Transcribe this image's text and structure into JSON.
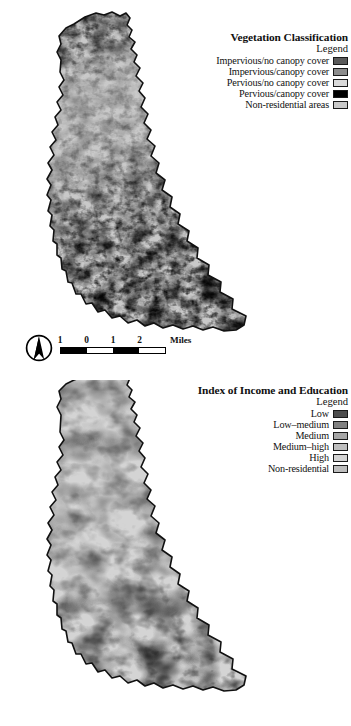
{
  "figure": {
    "panels": [
      {
        "id": "vegetation",
        "legend": {
          "title": "Vegetation Classification",
          "subtitle": "Legend",
          "items": [
            {
              "label": "Impervious/no canopy cover",
              "color": "#595959"
            },
            {
              "label": "Impervious/canopy cover",
              "color": "#8c8c8c"
            },
            {
              "label": "Pervious/no canopy cover",
              "color": "#d9d9d9"
            },
            {
              "label": "Pervious/canopy cover",
              "color": "#000000"
            },
            {
              "label": "Non-residential areas",
              "color": "#c9c9c9"
            }
          ]
        }
      },
      {
        "id": "index-of-income-and-education",
        "legend": {
          "title": "Index of Income and Education",
          "subtitle": "Legend",
          "items": [
            {
              "label": "Low",
              "color": "#4d4d4d"
            },
            {
              "label": "Low–medium",
              "color": "#808080"
            },
            {
              "label": "Medium",
              "color": "#a6a6a6"
            },
            {
              "label": "Medium–high",
              "color": "#bfbfbf"
            },
            {
              "label": "High",
              "color": "#d4d4d4"
            },
            {
              "label": "Non-residential",
              "color": "#bdbdbd"
            }
          ]
        }
      }
    ],
    "scalebar": {
      "tick_labels": [
        "1",
        "0",
        "1",
        "2"
      ],
      "units": "Miles",
      "segments": [
        "fill",
        "empty",
        "fill",
        "empty"
      ]
    },
    "north_arrow": {
      "icon": "north-arrow-icon"
    },
    "colors": {
      "page_background": "#ffffff",
      "boundary_outline": "#111111",
      "map_base_fill": "#c9c9c9"
    }
  }
}
